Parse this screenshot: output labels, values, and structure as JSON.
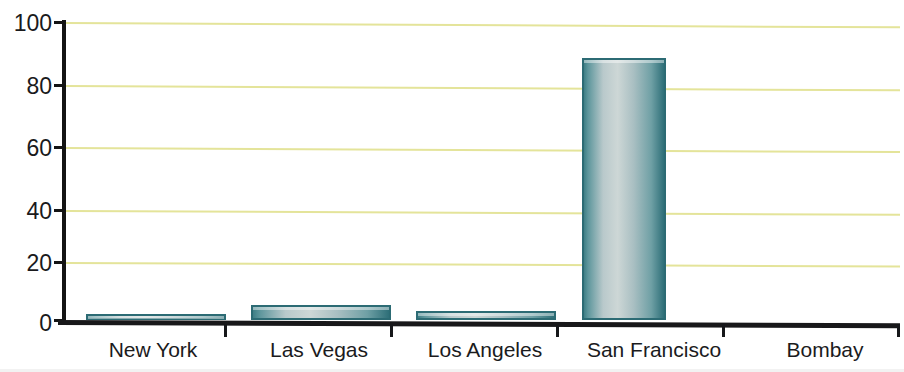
{
  "chart_data": {
    "type": "bar",
    "title": "",
    "subtitle": "",
    "xlabel": "",
    "ylabel": "",
    "categories": [
      "New York",
      "Las Vegas",
      "Los Angeles",
      "San Francisco",
      "Bombay"
    ],
    "values": [
      2,
      5,
      3,
      88,
      0
    ],
    "series": [
      {
        "name": "",
        "values": [
          2,
          5,
          3,
          88,
          0
        ]
      }
    ],
    "ylim": [
      0,
      100
    ],
    "yticks": [
      0,
      20,
      40,
      60,
      80,
      100
    ],
    "ytick_labels": [
      "0",
      "20",
      "40",
      "60",
      "80",
      "100"
    ],
    "grid": true,
    "grid_axis": "y",
    "legend": false,
    "legend_position": "none",
    "colors": {
      "grid": "#e4e49a",
      "axis": "#16171a",
      "bar_outline": "#2c6b74",
      "bar_fill_light": "#cdd7d6",
      "bar_fill_dark": "#2e6f78",
      "background": "#ffffff",
      "text": "#1a1a1c"
    }
  },
  "axes": {
    "y_tick_labels": [
      "100",
      "80",
      "60",
      "40",
      "20",
      "0"
    ],
    "x_tick_labels": [
      "New York",
      "Las Vegas",
      "Los Angeles",
      "San Francisco",
      "Bombay"
    ]
  },
  "bars": [
    {
      "label": "New York",
      "value": 2
    },
    {
      "label": "Las Vegas",
      "value": 5
    },
    {
      "label": "Los Angeles",
      "value": 3
    },
    {
      "label": "San Francisco",
      "value": 88
    },
    {
      "label": "Bombay",
      "value": 0
    }
  ],
  "title_sliver": {
    "text": ""
  }
}
